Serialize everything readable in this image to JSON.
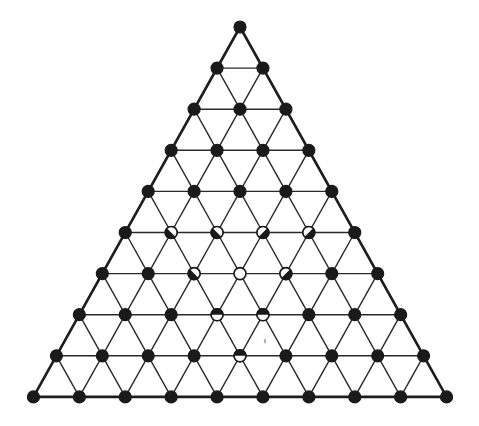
{
  "diagram": {
    "type": "triangular-lattice",
    "rows": 10,
    "apex": [
      240,
      27
    ],
    "row_spacing": 41.1,
    "col_spacing": 45.9,
    "node_radius": 6,
    "colors": {
      "ink": "#1a1a1a",
      "paper": "#ffffff",
      "speck": "#b0b0b0"
    },
    "special_nodes": [
      {
        "row": 5,
        "col": 1,
        "state": "half",
        "white_side": "upper-left"
      },
      {
        "row": 5,
        "col": 2,
        "state": "half",
        "white_side": "upper-left"
      },
      {
        "row": 5,
        "col": 3,
        "state": "half",
        "white_side": "upper-right"
      },
      {
        "row": 5,
        "col": 4,
        "state": "half",
        "white_side": "upper-right"
      },
      {
        "row": 6,
        "col": 2,
        "state": "half",
        "white_side": "upper-left"
      },
      {
        "row": 6,
        "col": 3,
        "state": "empty"
      },
      {
        "row": 6,
        "col": 4,
        "state": "half",
        "white_side": "upper-right"
      },
      {
        "row": 7,
        "col": 3,
        "state": "half",
        "white_side": "bottom"
      },
      {
        "row": 7,
        "col": 4,
        "state": "half",
        "white_side": "bottom"
      },
      {
        "row": 8,
        "col": 4,
        "state": "half",
        "white_side": "bottom"
      }
    ],
    "default_state": "filled",
    "speck": [
      265,
      341
    ]
  }
}
